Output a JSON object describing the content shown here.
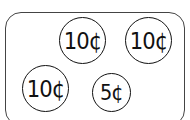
{
  "coins": [
    {
      "label": "10¢",
      "value": 10
    },
    {
      "label": "10¢",
      "value": 10
    },
    {
      "label": "10¢",
      "value": 10
    },
    {
      "label": "5¢",
      "value": 5
    }
  ]
}
